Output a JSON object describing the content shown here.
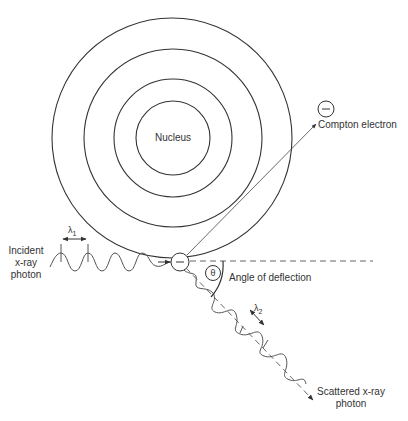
{
  "diagram": {
    "labels": {
      "nucleus": "Nucleus",
      "compton_electron": "Compton electron",
      "incident_line1": "Incident",
      "incident_line2": "x-ray",
      "incident_line3": "photon",
      "angle_of_deflection": "Angle of deflection",
      "theta": "θ",
      "lambda1": "λ",
      "lambda1_sub": "1",
      "lambda2": "λ",
      "lambda2_sub": "2",
      "scattered_line1": "Scattered x-ray",
      "scattered_line2": "photon",
      "electron_sign": "−",
      "compton_electron_sign": "−"
    },
    "geometry": {
      "atom_center": [
        173,
        138
      ],
      "shell_radii": [
        37,
        59,
        89,
        120
      ],
      "electron_position": [
        180,
        262
      ],
      "compton_electron_position": [
        326,
        109
      ]
    },
    "colors": {
      "line": "#333333",
      "background": "#ffffff"
    }
  }
}
